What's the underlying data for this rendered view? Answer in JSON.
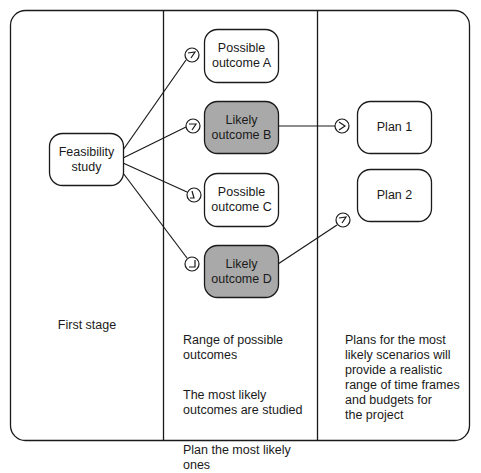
{
  "colors": {
    "stroke": "#1a1a1a",
    "box_fill": "#ffffff",
    "likely_fill": "#a9a9a9",
    "background": "#ffffff"
  },
  "columns": [
    {
      "id": "first-stage",
      "caption": "First stage"
    },
    {
      "id": "outcomes",
      "paragraphs": [
        "Range of possible\noutcomes",
        "The  most likely\noutcomes are studied",
        "Plan the most likely\nones"
      ]
    },
    {
      "id": "plans",
      "paragraphs": [
        "Plans for the most\nlikely scenarios will\nprovide a realistic\nrange of time frames\nand budgets for\nthe project"
      ]
    }
  ],
  "nodes": {
    "feasibility": {
      "label": "Feasibility\nstudy",
      "highlight": false
    },
    "outcome_a": {
      "label": "Possible\noutcome A",
      "highlight": false
    },
    "outcome_b": {
      "label": "Likely\noutcome B",
      "highlight": true
    },
    "outcome_c": {
      "label": "Possible\noutcome C",
      "highlight": false
    },
    "outcome_d": {
      "label": "Likely\noutcome D",
      "highlight": true
    },
    "plan_1": {
      "label": "Plan 1",
      "highlight": false
    },
    "plan_2": {
      "label": "Plan 2",
      "highlight": false
    }
  },
  "edges": [
    {
      "from": "feasibility",
      "to": "outcome_a",
      "marker": "arrow-circle"
    },
    {
      "from": "feasibility",
      "to": "outcome_b",
      "marker": "arrow-circle"
    },
    {
      "from": "feasibility",
      "to": "outcome_c",
      "marker": "arrow-circle"
    },
    {
      "from": "feasibility",
      "to": "outcome_d",
      "marker": "arrow-circle"
    },
    {
      "from": "outcome_b",
      "to": "plan_1",
      "marker": "arrow-circle"
    },
    {
      "from": "outcome_d",
      "to": "plan_2",
      "marker": "arrow-circle"
    }
  ]
}
